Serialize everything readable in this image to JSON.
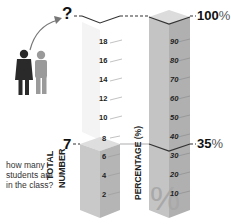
{
  "question": {
    "mark": "?",
    "lines": [
      "how many",
      "students are",
      "in the class?"
    ]
  },
  "left_bar": {
    "label_line1": "TOTAL",
    "label_line2": "NUMBER",
    "value_marker": "7",
    "ticks": [
      "18",
      "16",
      "14",
      "12",
      "10",
      "8",
      "6",
      "4",
      "2"
    ]
  },
  "right_bar": {
    "label": "PERCENTAGE (%)",
    "top_marker": "100",
    "top_marker_unit": "%",
    "value_marker": "35",
    "value_marker_unit": "%",
    "ticks": [
      "90",
      "80",
      "70",
      "60",
      "50",
      "40",
      "30",
      "20",
      "10"
    ],
    "watermark": "%"
  },
  "colors": {
    "bar_front": "#c9c9c9",
    "bar_side": "#b3b3b3",
    "bar_top": "#dedede",
    "text": "#222222",
    "question_text": "#333333"
  },
  "figures": [
    {
      "name": "dark-person",
      "color": "#2a2a2a"
    },
    {
      "name": "grey-person",
      "color": "#9a9a9a"
    }
  ]
}
